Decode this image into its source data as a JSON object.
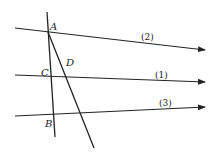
{
  "diagram": {
    "points": {
      "A": "A",
      "B": "B",
      "C": "C",
      "D": "D"
    },
    "lines": {
      "l1": "(1)",
      "l2": "(2)",
      "l3": "(3)"
    },
    "stroke_color": "#222222"
  }
}
